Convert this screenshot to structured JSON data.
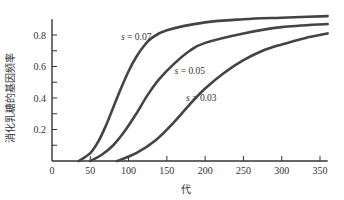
{
  "chart_data": {
    "type": "line",
    "title": "",
    "xlabel": "代",
    "ylabel": "消化乳糖的基因频率",
    "xlim": [
      0,
      360
    ],
    "ylim": [
      0,
      0.9
    ],
    "xticks": [
      0,
      50,
      100,
      150,
      200,
      250,
      300,
      350
    ],
    "xtick_labels": [
      "0",
      "50",
      "100",
      "150",
      "200",
      "250",
      "300",
      "350"
    ],
    "yticks": [
      0.1,
      0.2,
      0.3,
      0.4,
      0.5,
      0.6,
      0.7,
      0.8
    ],
    "ytick_labels": [
      "0.2",
      "0.4",
      "0.6",
      "0.8"
    ],
    "ytick_labeled_values": [
      0.2,
      0.4,
      0.6,
      0.8
    ],
    "grid": false,
    "legend": "inline annotations",
    "series": [
      {
        "name": "s = 0.07",
        "x": [
          35,
          50,
          60,
          70,
          80,
          90,
          100,
          110,
          120,
          130,
          150,
          200,
          250,
          300,
          360
        ],
        "y": [
          0.0,
          0.05,
          0.12,
          0.22,
          0.34,
          0.46,
          0.57,
          0.66,
          0.73,
          0.78,
          0.83,
          0.88,
          0.9,
          0.91,
          0.92
        ]
      },
      {
        "name": "s = 0.05",
        "x": [
          50,
          65,
          80,
          95,
          110,
          125,
          140,
          160,
          180,
          200,
          250,
          300,
          360
        ],
        "y": [
          0.0,
          0.04,
          0.1,
          0.19,
          0.3,
          0.42,
          0.52,
          0.62,
          0.7,
          0.75,
          0.81,
          0.85,
          0.87
        ]
      },
      {
        "name": "s = 0.03",
        "x": [
          85,
          110,
          135,
          160,
          180,
          200,
          225,
          250,
          275,
          300,
          330,
          360
        ],
        "y": [
          0.0,
          0.05,
          0.13,
          0.25,
          0.36,
          0.46,
          0.56,
          0.64,
          0.7,
          0.74,
          0.78,
          0.81
        ]
      }
    ],
    "annotations": [
      {
        "text": "s = 0.07",
        "x": 110,
        "y": 0.77
      },
      {
        "text": "s = 0.05",
        "x": 180,
        "y": 0.55
      },
      {
        "text": "s = 0.03",
        "x": 195,
        "y": 0.38
      }
    ]
  }
}
